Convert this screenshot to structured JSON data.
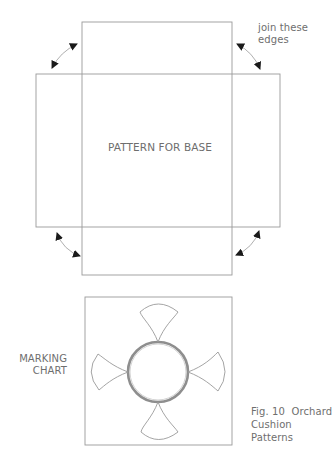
{
  "figure": {
    "caption_lines": [
      "Fig. 10  Orchard",
      "Cushion",
      "Patterns"
    ]
  },
  "base_pattern": {
    "label": "PATTERN FOR BASE",
    "annotation_lines": [
      "join these",
      "edges"
    ]
  },
  "marking_chart": {
    "label_lines": [
      "MARKING",
      "CHART"
    ]
  },
  "colors": {
    "line": "#9a9a9a",
    "text": "#6e6e6e",
    "arrow": "#1a1a1a"
  }
}
